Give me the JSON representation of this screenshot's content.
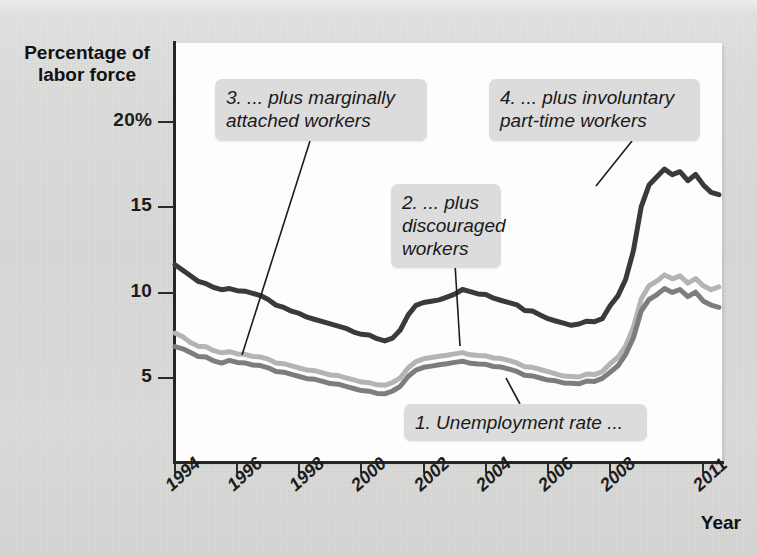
{
  "axes": {
    "ylabel_title": "Percentage of\nlabor force",
    "xlabel_title": "Year",
    "yticks": [
      {
        "value": 20,
        "label": "20%"
      },
      {
        "value": 15,
        "label": "15"
      },
      {
        "value": 10,
        "label": "10"
      },
      {
        "value": 5,
        "label": "5"
      }
    ],
    "xticks": [
      {
        "value": 1994,
        "label": "1994"
      },
      {
        "value": 1996,
        "label": "1996"
      },
      {
        "value": 1998,
        "label": "1998"
      },
      {
        "value": 2000,
        "label": "2000"
      },
      {
        "value": 2002,
        "label": "2002"
      },
      {
        "value": 2004,
        "label": "2004"
      },
      {
        "value": 2006,
        "label": "2006"
      },
      {
        "value": 2008,
        "label": "2008"
      },
      {
        "value": 2011,
        "label": "2011"
      }
    ]
  },
  "annotations": [
    {
      "id": "a1",
      "text": "1. Unemployment rate ...",
      "x": 404,
      "y": 404,
      "w": 243,
      "h": 36,
      "leader": [
        [
          520,
          404
        ],
        [
          506,
          378
        ]
      ]
    },
    {
      "id": "a2",
      "text": "2. ... plus\ndiscouraged\nworkers",
      "x": 391,
      "y": 184,
      "w": 110,
      "h": 80,
      "leader": [
        [
          455,
          264
        ],
        [
          460,
          346
        ]
      ]
    },
    {
      "id": "a3",
      "text": "3. ... plus marginally\nattached workers",
      "x": 215,
      "y": 79,
      "w": 212,
      "h": 62,
      "leader": [
        [
          310,
          141
        ],
        [
          242,
          355
        ]
      ]
    },
    {
      "id": "a4",
      "text": "4. ... plus involuntary\npart-time workers",
      "x": 489,
      "y": 79,
      "w": 211,
      "h": 62,
      "leader": [
        [
          632,
          141
        ],
        [
          596,
          186
        ]
      ]
    }
  ],
  "colors": {
    "series_dark": "#3a3a3a",
    "series_mid": "#7d7d7d",
    "series_light": "#b4b4b4",
    "axis": "#262626",
    "callout_bg": "#dcdcdc",
    "plot_bg": "#fdfdfd",
    "page_bg": "#d9d9d7"
  },
  "chart_data": {
    "type": "line",
    "title": "",
    "xlabel": "Year",
    "ylabel": "Percentage of labor force",
    "xlim": [
      1994,
      2011.6
    ],
    "ylim": [
      0,
      22.6
    ],
    "grid": false,
    "legend": "annotations-inline",
    "x": [
      1994.0,
      1994.25,
      1994.5,
      1994.75,
      1995.0,
      1995.25,
      1995.5,
      1995.75,
      1996.0,
      1996.25,
      1996.5,
      1996.75,
      1997.0,
      1997.25,
      1997.5,
      1997.75,
      1998.0,
      1998.25,
      1998.5,
      1998.75,
      1999.0,
      1999.25,
      1999.5,
      1999.75,
      2000.0,
      2000.25,
      2000.5,
      2000.75,
      2001.0,
      2001.25,
      2001.5,
      2001.75,
      2002.0,
      2002.25,
      2002.5,
      2002.75,
      2003.0,
      2003.25,
      2003.5,
      2003.75,
      2004.0,
      2004.25,
      2004.5,
      2004.75,
      2005.0,
      2005.25,
      2005.5,
      2005.75,
      2006.0,
      2006.25,
      2006.5,
      2006.75,
      2007.0,
      2007.25,
      2007.5,
      2007.75,
      2008.0,
      2008.25,
      2008.5,
      2008.75,
      2009.0,
      2009.25,
      2009.5,
      2009.75,
      2010.0,
      2010.25,
      2010.5,
      2010.75,
      2011.0,
      2011.25,
      2011.5
    ],
    "series": [
      {
        "name": "U-6: plus involuntary part-time workers",
        "annotation_id": "a4",
        "color": "#3a3a3a",
        "values": [
          11.6,
          11.3,
          11.0,
          10.7,
          10.5,
          10.3,
          10.2,
          10.2,
          10.1,
          10.1,
          10.0,
          9.8,
          9.6,
          9.3,
          9.1,
          8.9,
          8.8,
          8.6,
          8.4,
          8.3,
          8.2,
          8.0,
          7.9,
          7.7,
          7.6,
          7.5,
          7.3,
          7.2,
          7.3,
          7.8,
          8.7,
          9.3,
          9.4,
          9.5,
          9.6,
          9.7,
          9.9,
          10.2,
          10.1,
          9.9,
          9.9,
          9.7,
          9.5,
          9.4,
          9.3,
          9.0,
          8.9,
          8.7,
          8.5,
          8.3,
          8.2,
          8.1,
          8.2,
          8.3,
          8.3,
          8.5,
          9.2,
          9.8,
          10.8,
          12.5,
          15.0,
          16.3,
          16.8,
          17.2,
          16.9,
          17.1,
          16.6,
          16.9,
          16.3,
          15.9,
          15.7
        ]
      },
      {
        "name": "U-5: plus marginally attached workers",
        "annotation_id": "a3",
        "color": "#b4b4b4",
        "values": [
          7.6,
          7.4,
          7.1,
          6.9,
          6.8,
          6.6,
          6.5,
          6.5,
          6.4,
          6.4,
          6.3,
          6.2,
          6.1,
          5.9,
          5.8,
          5.7,
          5.6,
          5.5,
          5.4,
          5.3,
          5.2,
          5.1,
          5.0,
          4.9,
          4.8,
          4.7,
          4.6,
          4.6,
          4.7,
          5.0,
          5.6,
          6.0,
          6.1,
          6.2,
          6.3,
          6.3,
          6.4,
          6.5,
          6.4,
          6.3,
          6.3,
          6.2,
          6.1,
          6.0,
          5.9,
          5.7,
          5.6,
          5.5,
          5.4,
          5.2,
          5.1,
          5.1,
          5.1,
          5.2,
          5.2,
          5.4,
          5.8,
          6.2,
          6.9,
          8.0,
          9.6,
          10.4,
          10.7,
          11.0,
          10.8,
          11.0,
          10.6,
          10.8,
          10.4,
          10.2,
          10.3
        ]
      },
      {
        "name": "U-4: plus discouraged workers / unemployment rate",
        "annotation_id": "a2",
        "color": "#7d7d7d",
        "values": [
          6.8,
          6.7,
          6.5,
          6.3,
          6.2,
          6.0,
          5.9,
          6.0,
          5.9,
          5.9,
          5.8,
          5.7,
          5.6,
          5.4,
          5.3,
          5.2,
          5.1,
          5.0,
          4.9,
          4.8,
          4.7,
          4.6,
          4.5,
          4.4,
          4.3,
          4.2,
          4.1,
          4.1,
          4.2,
          4.5,
          5.1,
          5.5,
          5.6,
          5.7,
          5.8,
          5.8,
          5.9,
          6.0,
          5.9,
          5.8,
          5.8,
          5.7,
          5.6,
          5.5,
          5.4,
          5.2,
          5.1,
          5.0,
          4.9,
          4.8,
          4.7,
          4.7,
          4.7,
          4.8,
          4.8,
          5.0,
          5.3,
          5.7,
          6.4,
          7.4,
          8.9,
          9.6,
          9.9,
          10.2,
          10.0,
          10.2,
          9.8,
          10.0,
          9.5,
          9.3,
          9.1
        ]
      }
    ]
  }
}
